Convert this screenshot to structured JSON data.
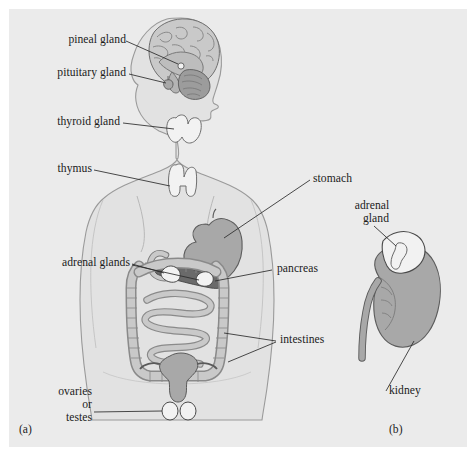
{
  "figure": {
    "background_color": "#ffffff",
    "panel_color": "#ebebeb",
    "ink_color": "#1b1b1b",
    "body_fill": "#e2e2e2",
    "organ_mid_gray": "#a8a8a8",
    "organ_dark_gray": "#6a6a6a",
    "organ_light_gray": "#c9c9c9",
    "organ_white": "#f2f2f2"
  },
  "panels": {
    "a": {
      "caption": "(a)",
      "description": "Human body silhouette showing endocrine gland locations"
    },
    "b": {
      "caption": "(b)",
      "description": "Close-up of kidney with adrenal gland"
    }
  },
  "labels": {
    "pineal_gland": "pineal gland",
    "pituitary_gland": "pituitary gland",
    "thyroid_gland": "thyroid gland",
    "thymus": "thymus",
    "adrenal_glands": "adrenal glands",
    "ovaries_line1": "ovaries",
    "ovaries_line2": "or",
    "ovaries_line3": "testes",
    "stomach": "stomach",
    "pancreas": "pancreas",
    "intestines": "intestines",
    "adrenal_gland_line1": "adrenal",
    "adrenal_gland_line2": "gland",
    "kidney": "kidney"
  },
  "structures": [
    {
      "name": "brain",
      "panel": "a",
      "fill": "#c9c9c9"
    },
    {
      "name": "pineal-gland",
      "panel": "a",
      "fill": "#f2f2f2"
    },
    {
      "name": "pituitary-gland",
      "panel": "a",
      "fill": "#a8a8a8"
    },
    {
      "name": "thyroid-gland",
      "panel": "a",
      "fill": "#f2f2f2"
    },
    {
      "name": "thymus",
      "panel": "a",
      "fill": "#f2f2f2"
    },
    {
      "name": "stomach",
      "panel": "a",
      "fill": "#a8a8a8"
    },
    {
      "name": "pancreas",
      "panel": "a",
      "fill": "#6a6a6a"
    },
    {
      "name": "large-intestine",
      "panel": "a",
      "fill": "#c9c9c9"
    },
    {
      "name": "small-intestine",
      "panel": "a",
      "fill": "#c9c9c9"
    },
    {
      "name": "adrenal-glands",
      "panel": "a",
      "fill": "#f2f2f2"
    },
    {
      "name": "uterus",
      "panel": "a",
      "fill": "#a8a8a8"
    },
    {
      "name": "ovaries",
      "panel": "a",
      "fill": "#f2f2f2"
    },
    {
      "name": "kidney",
      "panel": "b",
      "fill": "#a8a8a8"
    },
    {
      "name": "adrenal-gland",
      "panel": "b",
      "fill": "#f2f2f2"
    },
    {
      "name": "ureter",
      "panel": "b",
      "fill": "#a8a8a8"
    }
  ]
}
